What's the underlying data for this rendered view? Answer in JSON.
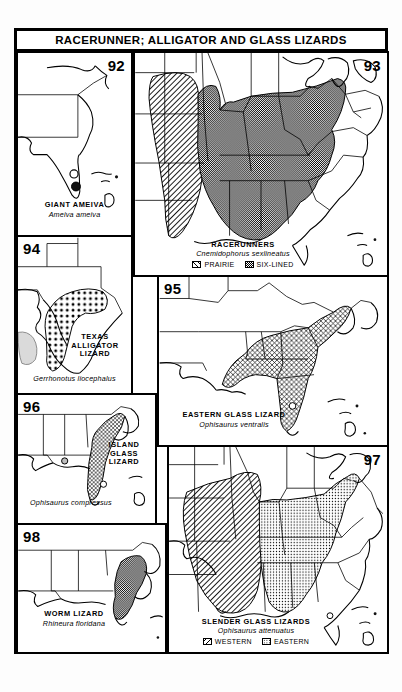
{
  "plate": {
    "title": "RACERUNNER; ALLIGATOR AND GLASS LIZARDS"
  },
  "panels": [
    {
      "number": "92",
      "common_name": "GIANT AMEIVA",
      "scientific_name": "Ameiva ameiva",
      "region": "southern Florida",
      "symbols": [
        "open-circle",
        "filled-circle"
      ],
      "legend": []
    },
    {
      "number": "93",
      "common_name": "RACERUNNERS",
      "scientific_name": "Cnemidophorus sexlineatus",
      "region": "central and southeastern United States",
      "legend": [
        {
          "label": "PRAIRIE",
          "pattern": "diagonal-hatch"
        },
        {
          "label": "SIX-LINED",
          "pattern": "gray-halftone"
        }
      ]
    },
    {
      "number": "94",
      "common_name": "TEXAS ALLIGATOR LIZARD",
      "common_name_lines": [
        "TEXAS",
        "ALLIGATOR",
        "LIZARD"
      ],
      "scientific_name": "Gerrhonotus liocephalus",
      "region": "central Texas",
      "legend": []
    },
    {
      "number": "95",
      "common_name": "EASTERN GLASS LIZARD",
      "scientific_name": "Ophisaurus ventralis",
      "region": "southeastern coastal plain",
      "legend": []
    },
    {
      "number": "96",
      "common_name": "ISLAND GLASS LIZARD",
      "common_name_lines": [
        "ISLAND",
        "GLASS",
        "LIZARD"
      ],
      "scientific_name": "Ophisaurus compressus",
      "region": "Florida peninsula and coastal Georgia",
      "legend": []
    },
    {
      "number": "97",
      "common_name": "SLENDER GLASS LIZARDS",
      "scientific_name": "Ophisaurus attenuatus",
      "region": "central and southeastern United States",
      "legend": [
        {
          "label": "WESTERN",
          "pattern": "diagonal-hatch"
        },
        {
          "label": "EASTERN",
          "pattern": "stipple"
        }
      ]
    },
    {
      "number": "98",
      "common_name": "WORM LIZARD",
      "scientific_name": "Rhineura floridana",
      "region": "northern Florida",
      "legend": []
    }
  ],
  "colors": {
    "ink": "#000000",
    "paper": "#ffffff",
    "page_background": "#fdfdfd"
  }
}
